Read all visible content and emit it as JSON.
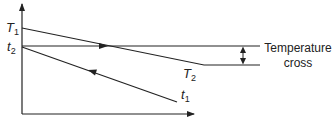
{
  "diagram": {
    "type": "temperature-profile",
    "labels": {
      "T1": {
        "base": "T",
        "sub": "1"
      },
      "t2": {
        "base": "t",
        "sub": "2"
      },
      "T2": {
        "base": "T",
        "sub": "2"
      },
      "t1": {
        "base": "t",
        "sub": "1"
      },
      "annotation_line1": "Temperature",
      "annotation_line2": "cross"
    },
    "axes": {
      "x_arrow": true,
      "y_arrow": true
    },
    "colors": {
      "line": "#222222",
      "background": "#ffffff"
    }
  }
}
